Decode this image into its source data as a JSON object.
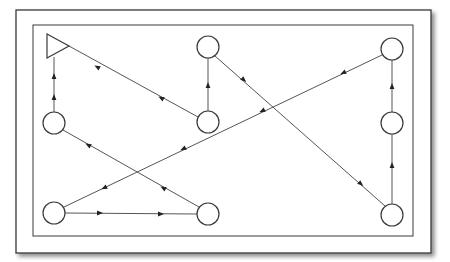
{
  "diagram": {
    "type": "directed-path-flow",
    "frame": {
      "outer": {
        "x": 16,
        "y": 10,
        "w": 415,
        "h": 243
      },
      "inner": {
        "x": 33,
        "y": 25,
        "w": 380,
        "h": 211
      }
    },
    "colors": {
      "stroke": "#3a3a3a",
      "edge": "#555555",
      "background": "#ffffff",
      "shadow": "#bdbdbd"
    },
    "start": {
      "id": "start",
      "shape": "triangle",
      "points": "47,34 47,58 69,46",
      "cx": 55,
      "cy": 46
    },
    "nodes": [
      {
        "id": "top-mid",
        "cx": 208,
        "cy": 47,
        "r": 11
      },
      {
        "id": "top-right",
        "cx": 392,
        "cy": 49,
        "r": 11
      },
      {
        "id": "left-mid",
        "cx": 54,
        "cy": 123,
        "r": 11
      },
      {
        "id": "center-mid",
        "cx": 208,
        "cy": 122,
        "r": 11
      },
      {
        "id": "right-mid",
        "cx": 392,
        "cy": 123,
        "r": 11
      },
      {
        "id": "bottom-left",
        "cx": 54,
        "cy": 213,
        "r": 11
      },
      {
        "id": "bottom-mid",
        "cx": 208,
        "cy": 214,
        "r": 11
      },
      {
        "id": "bottom-right",
        "cx": 392,
        "cy": 215,
        "r": 11
      }
    ],
    "edges": [
      {
        "from": "top-mid",
        "to": "bottom-right",
        "x1": 215,
        "y1": 56,
        "x2": 385,
        "y2": 206
      },
      {
        "from": "bottom-right",
        "to": "right-mid",
        "x1": 392,
        "y1": 204,
        "x2": 392,
        "y2": 134
      },
      {
        "from": "right-mid",
        "to": "top-right",
        "x1": 392,
        "y1": 112,
        "x2": 392,
        "y2": 60
      },
      {
        "from": "top-right",
        "to": "bottom-left",
        "x1": 382,
        "y1": 55,
        "x2": 64,
        "y2": 207
      },
      {
        "from": "bottom-left",
        "to": "bottom-mid",
        "x1": 65,
        "y1": 213,
        "x2": 197,
        "y2": 214
      },
      {
        "from": "bottom-mid",
        "to": "left-mid",
        "x1": 199,
        "y1": 207,
        "x2": 63,
        "y2": 130
      },
      {
        "from": "left-mid",
        "to": "start",
        "x1": 54,
        "y1": 112,
        "x2": 54,
        "y2": 57
      },
      {
        "from": "center-mid",
        "to": "top-mid",
        "x1": 208,
        "y1": 111,
        "x2": 208,
        "y2": 58
      },
      {
        "from": "center-mid",
        "to": "start",
        "x1": 198,
        "y1": 117,
        "x2": 69,
        "y2": 46
      }
    ],
    "arrowheads": [
      {
        "x": 97,
        "y": 67,
        "angle": 209
      },
      {
        "x": 161,
        "y": 98,
        "angle": 209
      },
      {
        "x": 208,
        "y": 85,
        "angle": 270
      },
      {
        "x": 54,
        "y": 97,
        "angle": 270
      },
      {
        "x": 54,
        "y": 76,
        "angle": 270
      },
      {
        "x": 244,
        "y": 80,
        "angle": 41
      },
      {
        "x": 361,
        "y": 184,
        "angle": 41
      },
      {
        "x": 392,
        "y": 165,
        "angle": 270
      },
      {
        "x": 392,
        "y": 86,
        "angle": 270
      },
      {
        "x": 343,
        "y": 73,
        "angle": 154
      },
      {
        "x": 262,
        "y": 111,
        "angle": 154
      },
      {
        "x": 183,
        "y": 149,
        "angle": 154
      },
      {
        "x": 104,
        "y": 188,
        "angle": 154
      },
      {
        "x": 163,
        "y": 188,
        "angle": 209
      },
      {
        "x": 88,
        "y": 145,
        "angle": 209
      },
      {
        "x": 100,
        "y": 213,
        "angle": 0
      },
      {
        "x": 161,
        "y": 214,
        "angle": 0
      }
    ]
  }
}
